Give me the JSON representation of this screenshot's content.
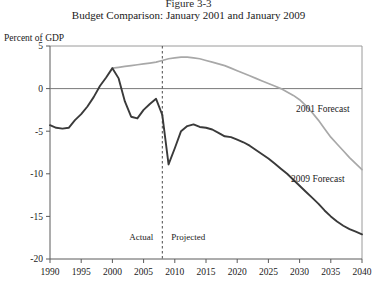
{
  "figure": {
    "number_line": "Figure 3-3",
    "caption": "Budget Comparison:  January 2001 and January 2009"
  },
  "axis_caption": "Percent of GDP",
  "annotations": {
    "actual": "Actual",
    "projected": "Projected",
    "divider_year": 2008
  },
  "labels": {
    "forecast_2001": "2001 Forecast",
    "forecast_2009": "2009 Forecast"
  },
  "colors": {
    "forecast_2001": "#a8a8a8",
    "forecast_2009": "#3a3a3a",
    "axis": "#7a7a7a",
    "frame": "#9a9a9a",
    "text": "#1a1a1a"
  },
  "chart_data": {
    "type": "line",
    "title": "Budget Comparison:  January 2001 and January 2009",
    "subtitle": "Figure 3-3",
    "xlabel": "",
    "ylabel": "Percent of GDP",
    "xlim": [
      1990,
      2040
    ],
    "ylim": [
      -20,
      5
    ],
    "xticks": [
      1990,
      1995,
      2000,
      2005,
      2010,
      2015,
      2020,
      2025,
      2030,
      2035,
      2040
    ],
    "yticks": [
      5,
      0,
      -5,
      -10,
      -15,
      -20
    ],
    "grid": false,
    "zero_line": true,
    "legend": "inline-annotations",
    "vertical_divider": {
      "x": 2008,
      "style": "dashed",
      "left_label": "Actual",
      "right_label": "Projected"
    },
    "series": [
      {
        "name": "2001 Forecast",
        "color": "#a8a8a8",
        "x": [
          2000,
          2001,
          2002,
          2003,
          2004,
          2005,
          2006,
          2007,
          2008,
          2009,
          2010,
          2011,
          2012,
          2013,
          2014,
          2015,
          2016,
          2017,
          2018,
          2019,
          2020,
          2021,
          2022,
          2023,
          2024,
          2025,
          2026,
          2027,
          2028,
          2029,
          2030,
          2031,
          2032,
          2033,
          2034,
          2035,
          2036,
          2037,
          2038,
          2039,
          2040
        ],
        "values": [
          2.4,
          2.5,
          2.6,
          2.7,
          2.8,
          2.9,
          3.0,
          3.1,
          3.3,
          3.5,
          3.6,
          3.7,
          3.7,
          3.6,
          3.5,
          3.3,
          3.1,
          2.9,
          2.7,
          2.4,
          2.1,
          1.8,
          1.5,
          1.2,
          0.9,
          0.6,
          0.3,
          0.0,
          -0.4,
          -0.8,
          -1.3,
          -2.0,
          -2.8,
          -3.7,
          -4.7,
          -5.7,
          -6.5,
          -7.3,
          -8.1,
          -8.8,
          -9.5
        ]
      },
      {
        "name": "Historical (Actual)",
        "color": "#3a3a3a",
        "x": [
          1990,
          1991,
          1992,
          1993,
          1994,
          1995,
          1996,
          1997,
          1998,
          1999,
          2000,
          2001,
          2002,
          2003,
          2004,
          2005,
          2006,
          2007,
          2008
        ],
        "values": [
          -4.3,
          -4.6,
          -4.7,
          -4.6,
          -3.7,
          -3.0,
          -2.1,
          -1.0,
          0.3,
          1.3,
          2.4,
          1.2,
          -1.5,
          -3.3,
          -3.5,
          -2.5,
          -1.8,
          -1.2,
          -3.1
        ]
      },
      {
        "name": "2009 Forecast",
        "color": "#3a3a3a",
        "x": [
          2008,
          2009,
          2010,
          2011,
          2012,
          2013,
          2014,
          2015,
          2016,
          2017,
          2018,
          2019,
          2020,
          2021,
          2022,
          2023,
          2024,
          2025,
          2026,
          2027,
          2028,
          2029,
          2030,
          2031,
          2032,
          2033,
          2034,
          2035,
          2036,
          2037,
          2038,
          2039,
          2040
        ],
        "values": [
          -3.1,
          -8.9,
          -7.0,
          -5.0,
          -4.4,
          -4.2,
          -4.5,
          -4.6,
          -4.8,
          -5.2,
          -5.6,
          -5.7,
          -6.0,
          -6.3,
          -6.7,
          -7.2,
          -7.7,
          -8.2,
          -8.8,
          -9.4,
          -10.0,
          -10.7,
          -11.4,
          -12.1,
          -12.8,
          -13.5,
          -14.3,
          -15.0,
          -15.6,
          -16.1,
          -16.5,
          -16.8,
          -17.1
        ]
      }
    ]
  }
}
